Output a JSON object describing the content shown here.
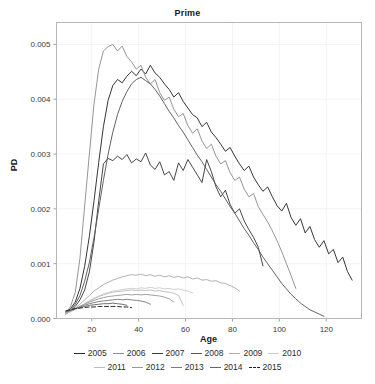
{
  "chart_data": {
    "type": "line",
    "title": "Prime",
    "xlabel": "Age",
    "ylabel": "PD",
    "xlim": [
      5,
      135
    ],
    "ylim": [
      0,
      0.0054
    ],
    "xticks": [
      20,
      40,
      60,
      80,
      100,
      120
    ],
    "yticks": [
      0.0,
      0.001,
      0.002,
      0.003,
      0.004,
      0.005
    ],
    "ytick_labels": [
      "0.000",
      "0.001",
      "0.002",
      "0.003",
      "0.004",
      "0.005"
    ],
    "xtick_labels": [
      "20",
      "40",
      "60",
      "80",
      "100",
      "120"
    ],
    "grid": true,
    "legend_position": "bottom",
    "series": [
      {
        "name": "2005",
        "color": "#2b2b2b",
        "dash": "solid",
        "x": [
          9,
          11,
          13,
          15,
          17,
          19,
          21,
          23,
          25,
          27,
          29,
          31,
          33,
          35,
          37,
          39,
          41,
          43,
          45,
          47,
          49,
          51,
          53,
          55,
          57,
          59,
          61,
          63,
          65,
          67,
          69,
          71,
          73,
          75,
          77,
          79,
          81,
          83,
          85,
          87,
          89,
          91,
          93,
          95,
          97,
          99,
          101,
          103,
          105,
          107,
          109,
          111,
          113,
          115,
          117,
          119,
          121,
          123,
          125,
          127,
          129,
          131
        ],
        "y": [
          0.00012,
          0.00018,
          0.0003,
          0.00055,
          0.00095,
          0.0015,
          0.00215,
          0.00285,
          0.0035,
          0.00398,
          0.00425,
          0.00436,
          0.0043,
          0.00442,
          0.00451,
          0.00443,
          0.00455,
          0.00446,
          0.00462,
          0.00448,
          0.0044,
          0.00428,
          0.00418,
          0.00404,
          0.00412,
          0.00396,
          0.00384,
          0.00372,
          0.00366,
          0.0035,
          0.00358,
          0.0034,
          0.0033,
          0.00318,
          0.00305,
          0.00312,
          0.00296,
          0.00282,
          0.0027,
          0.00278,
          0.00258,
          0.00244,
          0.00232,
          0.0024,
          0.00222,
          0.00206,
          0.00196,
          0.0021,
          0.00184,
          0.0017,
          0.00182,
          0.00156,
          0.00168,
          0.00144,
          0.0013,
          0.00142,
          0.00118,
          0.00126,
          0.00102,
          0.00112,
          0.00086,
          0.0007
        ]
      },
      {
        "name": "2006",
        "color": "#8f8f8f",
        "dash": "solid",
        "x": [
          9,
          11,
          13,
          15,
          17,
          19,
          21,
          23,
          25,
          27,
          29,
          31,
          33,
          35,
          37,
          39,
          41,
          43,
          45,
          47,
          49,
          51,
          53,
          55,
          57,
          59,
          61,
          63,
          65,
          67,
          69,
          71,
          73,
          75,
          77,
          79,
          81,
          83,
          85,
          87,
          89,
          91,
          93,
          95,
          97,
          99,
          101,
          103,
          105,
          107
        ],
        "y": [
          0.0001,
          0.00022,
          0.00048,
          0.0011,
          0.00205,
          0.003,
          0.00392,
          0.00455,
          0.00488,
          0.00496,
          0.005,
          0.00488,
          0.00497,
          0.00478,
          0.00468,
          0.00455,
          0.00462,
          0.0044,
          0.00428,
          0.00436,
          0.00412,
          0.00398,
          0.00404,
          0.00382,
          0.00368,
          0.00374,
          0.00352,
          0.00338,
          0.00346,
          0.00324,
          0.0031,
          0.00318,
          0.00296,
          0.00282,
          0.00288,
          0.00266,
          0.00252,
          0.00258,
          0.00236,
          0.00222,
          0.00228,
          0.00204,
          0.0019,
          0.00176,
          0.0016,
          0.00142,
          0.00122,
          0.001,
          0.00078,
          0.00055
        ]
      },
      {
        "name": "2007",
        "color": "#3d3d3d",
        "dash": "solid",
        "x": [
          9,
          11,
          13,
          15,
          17,
          19,
          21,
          23,
          25,
          27,
          29,
          31,
          33,
          35,
          37,
          39,
          41,
          43,
          45,
          47,
          49,
          51,
          53,
          55,
          57,
          59,
          61,
          63,
          65,
          67,
          69,
          71,
          73,
          75,
          77,
          79,
          81,
          83,
          85,
          87,
          89,
          91,
          93
        ],
        "y": [
          8e-05,
          0.00014,
          0.00022,
          0.00034,
          0.00052,
          0.00085,
          0.0014,
          0.00215,
          0.00282,
          0.00292,
          0.00288,
          0.00296,
          0.0029,
          0.00299,
          0.00284,
          0.00291,
          0.00286,
          0.00302,
          0.0028,
          0.00272,
          0.00286,
          0.00262,
          0.00268,
          0.00252,
          0.00284,
          0.0027,
          0.0029,
          0.00276,
          0.00262,
          0.00248,
          0.0029,
          0.00268,
          0.0024,
          0.00222,
          0.00234,
          0.00208,
          0.00192,
          0.002,
          0.00178,
          0.00162,
          0.00148,
          0.0013,
          0.00096
        ]
      },
      {
        "name": "2008",
        "color": "#5a5a5a",
        "dash": "solid",
        "x": [
          9,
          11,
          13,
          15,
          17,
          19,
          21,
          23,
          25,
          27,
          29,
          31,
          33,
          35,
          37,
          39,
          41,
          43,
          45,
          47,
          49,
          51,
          53,
          55,
          57,
          59,
          61,
          63,
          65,
          67,
          69,
          71,
          73,
          75,
          77,
          79,
          81,
          83,
          85,
          87,
          89,
          91,
          93,
          95,
          97,
          99,
          101,
          103,
          105,
          107,
          109,
          111,
          113,
          115,
          117,
          119
        ],
        "y": [
          9e-05,
          0.00015,
          0.00026,
          0.00042,
          0.00068,
          0.00102,
          0.00148,
          0.002,
          0.00252,
          0.003,
          0.0034,
          0.00372,
          0.00396,
          0.00414,
          0.00428,
          0.00436,
          0.0044,
          0.00434,
          0.00428,
          0.00418,
          0.00406,
          0.00392,
          0.00378,
          0.00366,
          0.00352,
          0.0034,
          0.00326,
          0.00312,
          0.00298,
          0.00286,
          0.00272,
          0.00258,
          0.00244,
          0.00232,
          0.00218,
          0.00204,
          0.00192,
          0.00178,
          0.00164,
          0.00152,
          0.00138,
          0.00126,
          0.00112,
          0.001,
          0.00088,
          0.00076,
          0.00064,
          0.00054,
          0.00044,
          0.00036,
          0.00028,
          0.00022,
          0.00016,
          0.00012,
          8e-05,
          4e-05
        ]
      },
      {
        "name": "2009",
        "color": "#adadad",
        "dash": "solid",
        "x": [
          9,
          11,
          13,
          15,
          17,
          19,
          21,
          23,
          25,
          27,
          29,
          31,
          33,
          35,
          37,
          39,
          41,
          43,
          45,
          47,
          49,
          51,
          53,
          55,
          57,
          59,
          61,
          63,
          65,
          67,
          69,
          71,
          73,
          75,
          77,
          79,
          81,
          83
        ],
        "y": [
          0.0001,
          0.00014,
          0.00019,
          0.00026,
          0.00034,
          0.00042,
          0.0005,
          0.00056,
          0.00062,
          0.00066,
          0.0007,
          0.00073,
          0.00076,
          0.00078,
          0.0008,
          0.00079,
          0.00081,
          0.00078,
          0.0008,
          0.00077,
          0.00079,
          0.00076,
          0.00078,
          0.00075,
          0.00077,
          0.00074,
          0.00076,
          0.00072,
          0.00074,
          0.0007,
          0.00071,
          0.00068,
          0.00069,
          0.00065,
          0.00064,
          0.0006,
          0.00056,
          0.0005
        ]
      },
      {
        "name": "2010",
        "color": "#cccccc",
        "dash": "solid",
        "x": [
          9,
          11,
          13,
          15,
          17,
          19,
          21,
          23,
          25,
          27,
          29,
          31,
          33,
          35,
          37,
          39,
          41,
          43,
          45,
          47,
          49,
          51,
          53,
          55,
          57,
          59,
          61,
          63
        ],
        "y": [
          9e-05,
          0.00012,
          0.00016,
          0.00021,
          0.00027,
          0.00032,
          0.00037,
          0.00041,
          0.00045,
          0.00047,
          0.0005,
          0.00051,
          0.00053,
          0.00054,
          0.00055,
          0.00054,
          0.00056,
          0.00055,
          0.00057,
          0.00055,
          0.00056,
          0.00054,
          0.00055,
          0.00053,
          0.00054,
          0.00052,
          0.0005,
          0.00047
        ]
      },
      {
        "name": "2011",
        "color": "#bdbdbd",
        "dash": "solid",
        "x": [
          9,
          11,
          13,
          15,
          17,
          19,
          21,
          23,
          25,
          27,
          29,
          31,
          33,
          35,
          37,
          39,
          41,
          43,
          45,
          47,
          49,
          51,
          53,
          55,
          57,
          59
        ],
        "y": [
          0.0001,
          0.00013,
          0.00017,
          0.00022,
          0.00027,
          0.00032,
          0.00036,
          0.0004,
          0.00043,
          0.00046,
          0.00048,
          0.00049,
          0.0005,
          0.00051,
          0.00052,
          0.00051,
          0.00052,
          0.00051,
          0.00052,
          0.0005,
          0.00051,
          0.00049,
          0.00048,
          0.00046,
          0.00042,
          0.00024
        ]
      },
      {
        "name": "2012",
        "color": "#9a9a9a",
        "dash": "solid",
        "x": [
          9,
          11,
          13,
          15,
          17,
          19,
          21,
          23,
          25,
          27,
          29,
          31,
          33,
          35,
          37,
          39,
          41,
          43,
          45,
          47,
          49,
          51,
          53,
          55
        ],
        "y": [
          0.00011,
          0.00014,
          0.00018,
          0.00022,
          0.00026,
          0.0003,
          0.00033,
          0.00036,
          0.00038,
          0.0004,
          0.00041,
          0.00042,
          0.00043,
          0.00044,
          0.00043,
          0.00044,
          0.00043,
          0.00044,
          0.00043,
          0.00042,
          0.00041,
          0.00039,
          0.00036,
          0.0003
        ]
      },
      {
        "name": "2013",
        "color": "#7d7d7d",
        "dash": "solid",
        "x": [
          9,
          11,
          13,
          15,
          17,
          19,
          21,
          23,
          25,
          27,
          29,
          31,
          33,
          35,
          37,
          39,
          41,
          43,
          45
        ],
        "y": [
          0.00012,
          0.00015,
          0.00018,
          0.00021,
          0.00024,
          0.00027,
          0.00029,
          0.00031,
          0.00032,
          0.00033,
          0.00034,
          0.00035,
          0.00034,
          0.00035,
          0.00034,
          0.00033,
          0.00032,
          0.0003,
          0.00026
        ]
      },
      {
        "name": "2014",
        "color": "#666666",
        "dash": "solid",
        "x": [
          9,
          11,
          13,
          15,
          17,
          19,
          21,
          23,
          25,
          27,
          29,
          31,
          33,
          35
        ],
        "y": [
          0.00013,
          0.00015,
          0.00018,
          0.0002,
          0.00022,
          0.00024,
          0.00025,
          0.00026,
          0.00027,
          0.00027,
          0.00028,
          0.00027,
          0.00026,
          0.00024
        ]
      },
      {
        "name": "2015",
        "color": "#1f1f1f",
        "dash": "dashed",
        "x": [
          9,
          11,
          13,
          15,
          17,
          19,
          21,
          23,
          25,
          27,
          29,
          31,
          33,
          35,
          37
        ],
        "y": [
          0.00014,
          0.00016,
          0.00018,
          0.00019,
          0.0002,
          0.00021,
          0.00021,
          0.00022,
          0.00022,
          0.00022,
          0.00022,
          0.00022,
          0.00021,
          0.00021,
          0.0002
        ]
      }
    ]
  },
  "legend": {
    "rows": [
      [
        "2005",
        "2006",
        "2007",
        "2008",
        "2009",
        "2010"
      ],
      [
        "2011",
        "2012",
        "2013",
        "2014",
        "2015"
      ]
    ]
  }
}
